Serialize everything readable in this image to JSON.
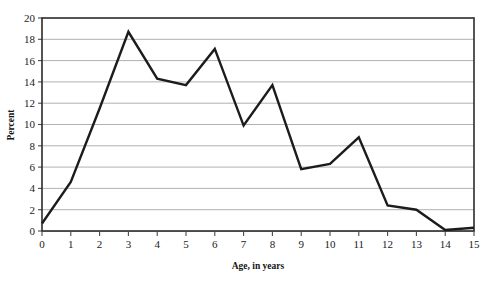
{
  "chart_data": {
    "type": "line",
    "title": "",
    "xlabel": "Age, in years",
    "ylabel": "Percent",
    "x": [
      0,
      1,
      2,
      3,
      4,
      5,
      6,
      7,
      8,
      9,
      10,
      11,
      12,
      13,
      14,
      15
    ],
    "values": [
      0.7,
      4.6,
      11.5,
      18.7,
      14.3,
      13.7,
      17.1,
      9.9,
      13.7,
      5.8,
      6.3,
      8.8,
      2.4,
      2.0,
      0.1,
      0.3
    ],
    "series": [
      {
        "name": "Percent",
        "values": [
          0.7,
          4.6,
          11.5,
          18.7,
          14.3,
          13.7,
          17.1,
          9.9,
          13.7,
          5.8,
          6.3,
          8.8,
          2.4,
          2.0,
          0.1,
          0.3
        ]
      }
    ],
    "xlim": [
      0,
      15
    ],
    "ylim": [
      0,
      20
    ],
    "x_ticks": [
      0,
      1,
      2,
      3,
      4,
      5,
      6,
      7,
      8,
      9,
      10,
      11,
      12,
      13,
      14,
      15
    ],
    "x_tick_labels": [
      "0",
      "1",
      "2",
      "3",
      "4",
      "5",
      "6",
      "7",
      "8",
      "9",
      "10",
      "11",
      "12",
      "13",
      "14",
      "15"
    ],
    "y_ticks": [
      0,
      2,
      4,
      6,
      8,
      10,
      12,
      14,
      16,
      18,
      20
    ],
    "y_tick_labels": [
      "0",
      "2",
      "4",
      "6",
      "8",
      "10",
      "12",
      "14",
      "16",
      "18",
      "20"
    ],
    "grid": "horizontal",
    "legend": "none",
    "line_color": "#1c1c1c",
    "grid_color": "#a8a8a8",
    "frame_color": "#2b2b2b"
  },
  "axes": {
    "x_title": "Age, in years",
    "y_title": "Percent"
  }
}
